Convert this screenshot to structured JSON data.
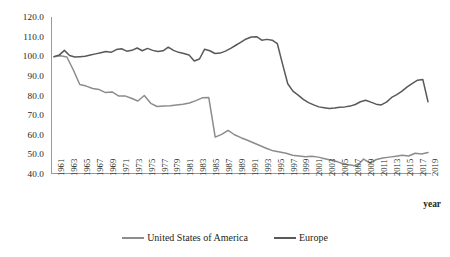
{
  "chart_data": {
    "type": "line",
    "title": "",
    "xlabel": "year",
    "ylabel": "",
    "ylim": [
      40.0,
      120.0
    ],
    "ytick_step": 10.0,
    "yticks": [
      "120.0",
      "110.0",
      "100.0",
      "90.0",
      "80.0",
      "70.0",
      "60.0",
      "50.0",
      "40.0"
    ],
    "grid": false,
    "legend_position": "bottom-center",
    "x_range": [
      1961,
      2019
    ],
    "x_tick_labels": [
      "1961",
      "1963",
      "1965",
      "1967",
      "1969",
      "1971",
      "1973",
      "1975",
      "1977",
      "1979",
      "1981",
      "1983",
      "1985",
      "1987",
      "1989",
      "1991",
      "1993",
      "1995",
      "1997",
      "1999",
      "2001",
      "2003",
      "2005",
      "2007",
      "2009",
      "2011",
      "2013",
      "2015",
      "2017",
      "2019"
    ],
    "x_all_years": [
      1961,
      1962,
      1963,
      1964,
      1965,
      1966,
      1967,
      1968,
      1969,
      1970,
      1971,
      1972,
      1973,
      1974,
      1975,
      1976,
      1977,
      1978,
      1979,
      1980,
      1981,
      1982,
      1983,
      1984,
      1985,
      1986,
      1987,
      1988,
      1989,
      1990,
      1991,
      1992,
      1993,
      1994,
      1995,
      1996,
      1997,
      1998,
      1999,
      2000,
      2001,
      2002,
      2003,
      2004,
      2005,
      2006,
      2007,
      2008,
      2009,
      2010,
      2011,
      2012,
      2013,
      2014,
      2015,
      2016,
      2017,
      2018,
      2019
    ],
    "series": [
      {
        "name": "United States of America",
        "color": "#8c8c8c",
        "values": [
          99.8,
          100.2,
          99.6,
          93.0,
          85.6,
          84.8,
          83.6,
          83.0,
          81.5,
          81.8,
          79.8,
          79.8,
          78.6,
          77.2,
          80.0,
          76.0,
          74.4,
          74.6,
          74.8,
          75.2,
          75.6,
          76.2,
          77.4,
          78.8,
          79.0,
          58.8,
          60.2,
          62.2,
          60.0,
          58.5,
          57.2,
          55.8,
          54.4,
          53.0,
          51.8,
          51.2,
          50.6,
          49.6,
          49.2,
          48.8,
          49.0,
          48.6,
          47.8,
          47.0,
          46.2,
          45.0,
          44.6,
          44.0,
          47.6,
          45.6,
          47.4,
          48.2,
          48.6,
          49.0,
          49.6,
          49.2,
          50.6,
          50.2,
          51.0
        ]
      },
      {
        "name": "Europe",
        "color": "#595959",
        "values": [
          99.8,
          100.6,
          103.0,
          100.4,
          99.6,
          99.8,
          100.0,
          100.6,
          101.2,
          101.8,
          102.4,
          102.0,
          103.4,
          103.8,
          102.6,
          103.0,
          104.2,
          102.8,
          104.0,
          103.0,
          102.4,
          102.8,
          104.6,
          103.0,
          102.0,
          101.4,
          100.6,
          97.6,
          98.6,
          103.6,
          102.8,
          101.4,
          101.6,
          102.6,
          104.0,
          105.6,
          107.2,
          108.8,
          109.8,
          110.0,
          108.2,
          108.6,
          108.2,
          106.4,
          96.0,
          86.0,
          82.2,
          80.2,
          78.0,
          76.4,
          75.2,
          74.2,
          73.8,
          73.4,
          73.6,
          74.0,
          74.2,
          74.6,
          75.4,
          76.8,
          77.6,
          76.6,
          75.6,
          75.2,
          76.6,
          79.0,
          80.4,
          82.2,
          84.4,
          86.2,
          87.8,
          88.2,
          76.8
        ]
      }
    ]
  },
  "legend": {
    "items": [
      {
        "label": "United States of America",
        "color": "#8c8c8c"
      },
      {
        "label": "Europe",
        "color": "#595959"
      }
    ]
  },
  "axis": {
    "x_title": "year"
  }
}
